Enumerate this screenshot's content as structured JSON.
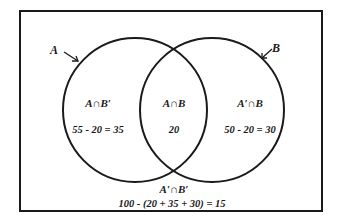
{
  "diagram": {
    "type": "venn",
    "universe_total": "100",
    "sets": {
      "A": {
        "label": "A",
        "total": "55"
      },
      "B": {
        "label": "B",
        "total": "50"
      }
    },
    "regions": {
      "a_only": {
        "label": "A∩B′",
        "value": "55 - 20 = 35"
      },
      "both": {
        "label": "A∩B",
        "value": "20"
      },
      "b_only": {
        "label": "A′∩B",
        "value": "50 - 20 = 30"
      },
      "neither": {
        "label": "A′∩B′",
        "value": "100 - (20 + 35 + 30) = 15"
      }
    },
    "colors": {
      "stroke": "#1a1a1a",
      "background": "#ffffff"
    }
  }
}
